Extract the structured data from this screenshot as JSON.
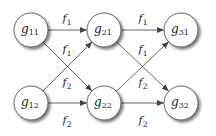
{
  "diagram": {
    "type": "layered-directed-graph",
    "colors": {
      "node_fill": "#ffffff",
      "node_stroke": "#555555",
      "edge": "#555555",
      "text": "#222222",
      "shadow": "#9a9a9a"
    },
    "nodes": [
      {
        "id": "g11",
        "base": "g",
        "sub": "11",
        "x": 31,
        "y": 30,
        "r": 17
      },
      {
        "id": "g12",
        "base": "g",
        "sub": "12",
        "x": 31,
        "y": 103,
        "r": 17
      },
      {
        "id": "g21",
        "base": "g",
        "sub": "21",
        "x": 104,
        "y": 30,
        "r": 17
      },
      {
        "id": "g22",
        "base": "g",
        "sub": "22",
        "x": 104,
        "y": 103,
        "r": 17
      },
      {
        "id": "g31",
        "base": "g",
        "sub": "31",
        "x": 181,
        "y": 30,
        "r": 17
      },
      {
        "id": "g32",
        "base": "g",
        "sub": "32",
        "x": 181,
        "y": 103,
        "r": 17
      }
    ],
    "edges": [
      {
        "from": "g11",
        "to": "g21",
        "label": {
          "base": "f",
          "sub": "1",
          "x": 67,
          "y": 22
        }
      },
      {
        "from": "g11",
        "to": "g22",
        "label": {
          "base": "f",
          "sub": "1",
          "x": 67,
          "y": 53
        }
      },
      {
        "from": "g12",
        "to": "g21",
        "label": {
          "base": "f",
          "sub": "2",
          "x": 67,
          "y": 86
        }
      },
      {
        "from": "g12",
        "to": "g22",
        "label": {
          "base": "f",
          "sub": "2",
          "x": 67,
          "y": 124
        }
      },
      {
        "from": "g21",
        "to": "g31",
        "label": {
          "base": "f",
          "sub": "1",
          "x": 143,
          "y": 22
        }
      },
      {
        "from": "g21",
        "to": "g32",
        "label": {
          "base": "f",
          "sub": "1",
          "x": 143,
          "y": 53
        }
      },
      {
        "from": "g22",
        "to": "g31",
        "label": {
          "base": "f",
          "sub": "2",
          "x": 143,
          "y": 86
        }
      },
      {
        "from": "g22",
        "to": "g32",
        "label": {
          "base": "f",
          "sub": "2",
          "x": 143,
          "y": 124
        }
      }
    ]
  }
}
